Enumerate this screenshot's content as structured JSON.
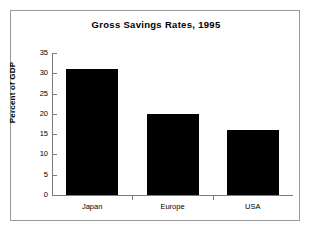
{
  "chart_data": {
    "type": "bar",
    "title": "Gross Savings Rates, 1995",
    "xlabel": "",
    "ylabel": "Percent of GDP",
    "categories": [
      "Japan",
      "Europe",
      "USA"
    ],
    "values": [
      31,
      20,
      16
    ],
    "ylim": [
      0,
      35
    ],
    "yticks": [
      0,
      5,
      10,
      15,
      20,
      25,
      30,
      35
    ],
    "ytick_labels": [
      "0",
      "5",
      "10",
      "15",
      "20",
      "25",
      "30",
      "35"
    ],
    "grid": false,
    "legend": null,
    "bar_color": "#000000",
    "axis_color": "#7c7c7c",
    "background": "#ffffff",
    "frame_color": "#9b9b9b"
  }
}
